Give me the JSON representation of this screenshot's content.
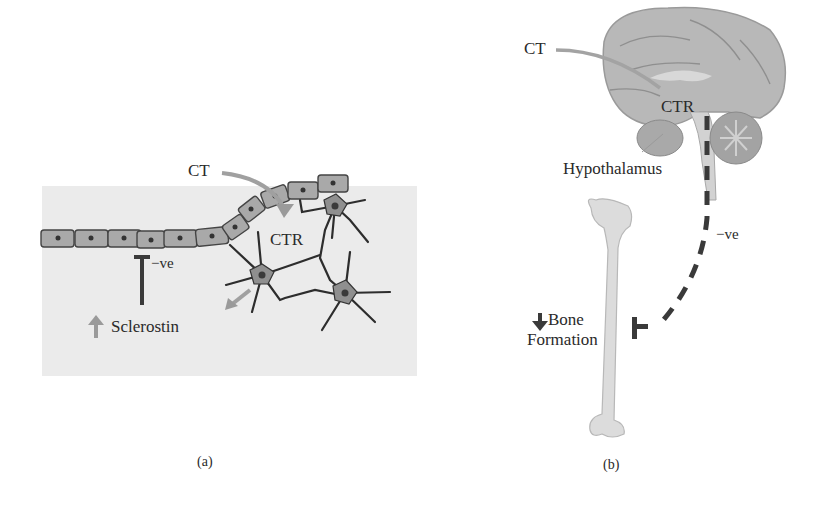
{
  "panel_a": {
    "caption": "(a)",
    "labels": {
      "ct": "CT",
      "ctr": "CTR",
      "negative": "−ve",
      "sclerostin": "Sclerostin"
    },
    "icons": {
      "sclerostin_arrow": "up-arrow-icon",
      "inhibition": "t-bar-inhibition-icon",
      "ct_arrow": "curved-arrow-icon"
    },
    "colors": {
      "tissue": "#eaeaea",
      "cell_fill": "#a8a8a8",
      "cell_stroke": "#444444",
      "osteocyte": "#8e8e8e",
      "arrow": "#9a9a9a",
      "line": "#333333"
    }
  },
  "panel_b": {
    "caption": "(b)",
    "labels": {
      "ct": "CT",
      "ctr": "CTR",
      "hypothalamus": "Hypothalamus",
      "negative": "−ve",
      "bone_line1": "Bone",
      "bone_line2": "Formation"
    },
    "icons": {
      "bone_arrow": "down-arrow-icon",
      "brain": "brain-illustration",
      "femur": "femur-bone-illustration",
      "inhibition": "dashed-inhibition-line-icon"
    },
    "colors": {
      "brain": "#b5b5b5",
      "bone": "#dcdcdc",
      "dash": "#3a3a3a"
    }
  }
}
